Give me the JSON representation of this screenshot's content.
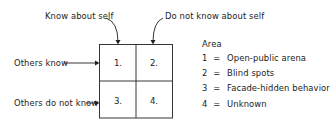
{
  "diagram": {
    "type": "johari-window",
    "column_labels": [
      "Know about self",
      "Do not know about self"
    ],
    "row_labels": [
      "Others know",
      "Others do not know"
    ],
    "cells": [
      "1.",
      "2.",
      "3.",
      "4."
    ],
    "legend": {
      "title": "Area",
      "items": [
        {
          "num": "1",
          "sep": "=",
          "label": "Open-public arena"
        },
        {
          "num": "2",
          "sep": "=",
          "label": "Blind spots"
        },
        {
          "num": "3",
          "sep": "=",
          "label": "Facade-hidden behavior"
        },
        {
          "num": "4",
          "sep": "=",
          "label": "Unknown"
        }
      ]
    },
    "colors": {
      "ink": "#222222",
      "background": "#ffffff"
    }
  }
}
